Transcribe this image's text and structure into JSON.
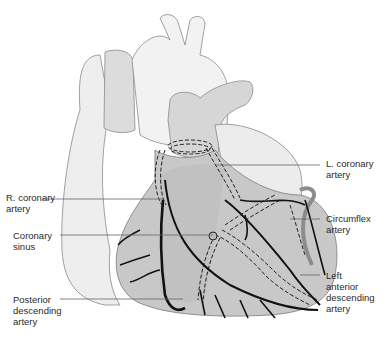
{
  "diagram": {
    "colors": {
      "outer_heart": "#eeeeee",
      "vessels_light": "#d9d9d9",
      "ventricle": "#c4c4c4",
      "artery_line": "#1a1a1a",
      "leader_line": "#666666",
      "outline": "#8a8a8a"
    },
    "labels": {
      "l_coronary": "L. coronary\nartery",
      "r_coronary": "R. coronary\nartery",
      "circumflex": "Circumflex\nartery",
      "coronary_sinus": "Coronary\nsinus",
      "lad": "Left\nanterior\ndescending\nartery",
      "posterior_descending": "Posterior\ndescending\nartery"
    }
  }
}
